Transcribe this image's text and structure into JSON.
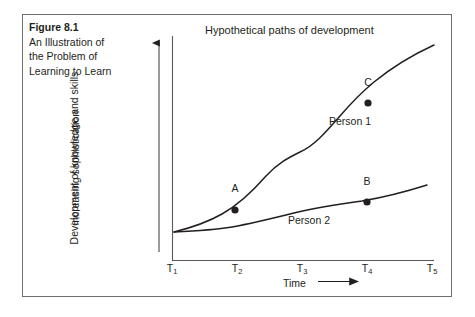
{
  "figure": {
    "caption_title": "Figure 8.1",
    "caption_lines": [
      "An Illustration of",
      "the Problem of",
      "Learning to Learn"
    ]
  },
  "chart_data": {
    "type": "line",
    "title": "Hypothetical paths of development",
    "xlabel": "Time",
    "xlabel_arrow": "⟶",
    "ylabel": "Development of knowledge and skills",
    "ylabel_secondary": "increasing sophistication",
    "ylabel_arrow": "up-arrow",
    "grid": false,
    "legend": "inline-curve-labels",
    "x_tick_labels": [
      "T",
      "T",
      "T",
      "T",
      "T"
    ],
    "x_tick_subscripts": [
      "1",
      "2",
      "3",
      "4",
      "5"
    ],
    "categories": [
      "T1",
      "T2",
      "T3",
      "T4",
      "T5"
    ],
    "axis_pixels": {
      "x_origin": 172,
      "y_origin": 260,
      "x_end": 434,
      "y_top": 36,
      "tick_x": [
        172,
        237,
        302,
        367,
        432
      ]
    },
    "series": [
      {
        "name": "Person 1",
        "label_position": {
          "x": 329,
          "y": 122
        },
        "path": "M174,232 C190,228 208,222 222,214 C238,205 252,192 266,176 C278,163 288,158 300,152 C314,146 326,132 340,116 C352,102 362,92 374,82 C390,69 410,56 434,45",
        "points": [
          {
            "label": "A",
            "x": 235,
            "y": 210,
            "label_x": 235,
            "label_y": 189
          },
          {
            "label": "C",
            "x": 368,
            "y": 103,
            "label_x": 368,
            "label_y": 83
          }
        ]
      },
      {
        "name": "Person 2",
        "label_position": {
          "x": 288,
          "y": 221
        },
        "path": "M174,232 C196,231 214,230 232,227 C254,223 274,218 294,213 C318,207 340,204 362,201 C386,197 408,191 427,185",
        "points": [
          {
            "label": "B",
            "x": 367,
            "y": 202,
            "label_x": 367,
            "label_y": 182
          }
        ]
      }
    ],
    "colors": {
      "curve": "#231f20",
      "axis": "#5a5a5a",
      "frame": "#6f6f6f",
      "text": "#231f20",
      "background": "#ffffff"
    }
  }
}
